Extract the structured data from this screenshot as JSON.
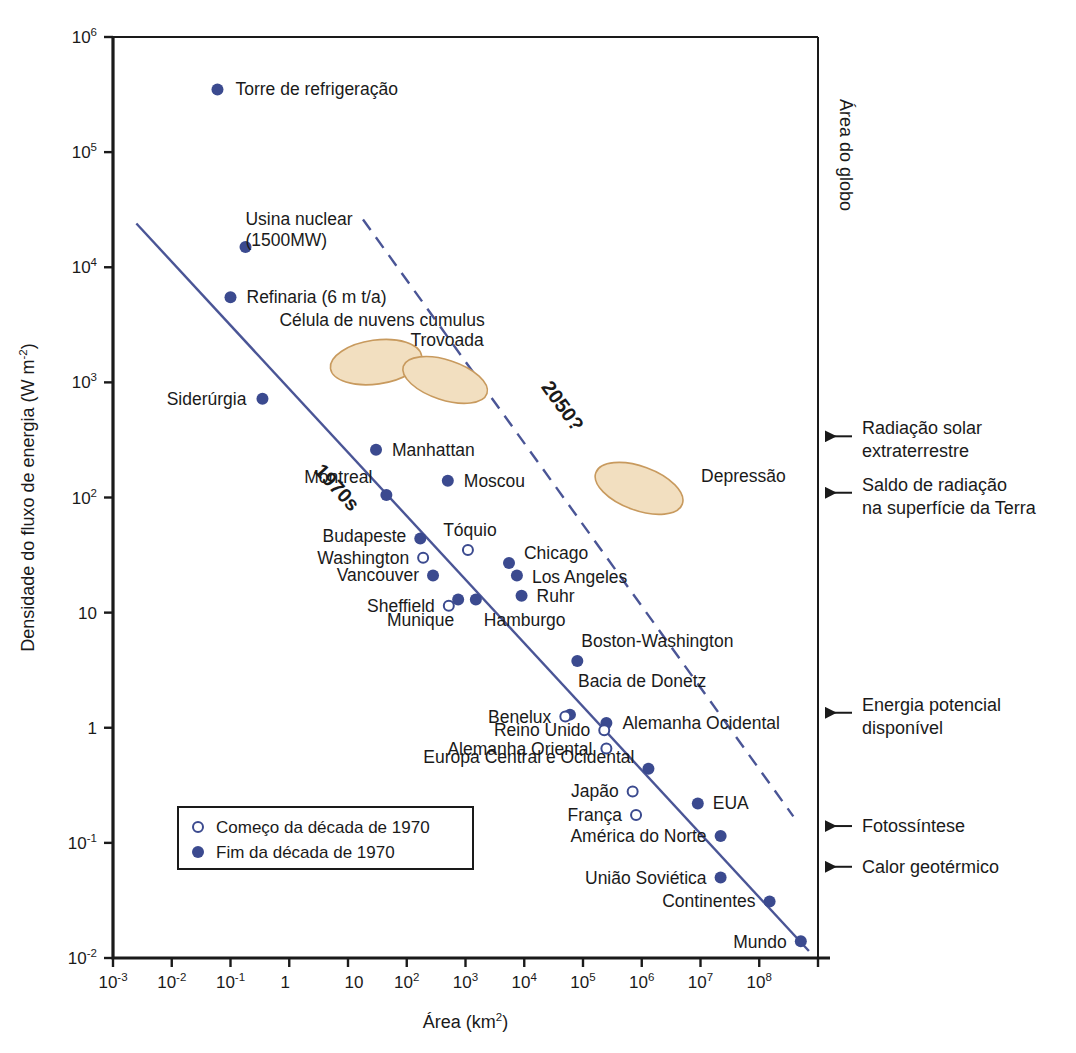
{
  "chart_data": {
    "type": "scatter",
    "title": "",
    "xlabel": "Área (km²)",
    "ylabel": "Densidade do fluxo de energia (W m⁻²)",
    "xscale": "log",
    "yscale": "log",
    "xlim": [
      0.001,
      1000000000
    ],
    "ylim": [
      0.01,
      1000000
    ],
    "grid": false,
    "legend_position": "bottom-left",
    "x_ticks": [
      {
        "label_base": "10",
        "label_exp": "-3",
        "value": 0.001
      },
      {
        "label_base": "10",
        "label_exp": "-2",
        "value": 0.01
      },
      {
        "label_base": "10",
        "label_exp": "-1",
        "value": 0.1
      },
      {
        "label_base": "1",
        "label_exp": "",
        "value": 1
      },
      {
        "label_base": "10",
        "label_exp": "",
        "value": 10
      },
      {
        "label_base": "",
        "label_exp": "",
        "value": 100
      },
      {
        "label_base": "10",
        "label_exp": "2",
        "value": 100
      },
      {
        "label_base": "10",
        "label_exp": "3",
        "value": 1000
      },
      {
        "label_base": "10",
        "label_exp": "4",
        "value": 10000
      },
      {
        "label_base": "10",
        "label_exp": "5",
        "value": 100000
      },
      {
        "label_base": "10",
        "label_exp": "6",
        "value": 1000000
      },
      {
        "label_base": "10",
        "label_exp": "7",
        "value": 10000000
      },
      {
        "label_base": "10",
        "label_exp": "8",
        "value": 100000000
      }
    ],
    "y_ticks": [
      {
        "label_base": "10",
        "label_exp": "6",
        "value": 1000000
      },
      {
        "label_base": "10",
        "label_exp": "5",
        "value": 100000
      },
      {
        "label_base": "10",
        "label_exp": "4",
        "value": 10000
      },
      {
        "label_base": "10",
        "label_exp": "3",
        "value": 1000
      },
      {
        "label_base": "10",
        "label_exp": "2",
        "value": 100
      },
      {
        "label_base": "10",
        "label_exp": "",
        "value": 10
      },
      {
        "label_base": "1",
        "label_exp": "",
        "value": 1
      },
      {
        "label_base": "10",
        "label_exp": "-1",
        "value": 0.1
      },
      {
        "label_base": "10",
        "label_exp": "-2",
        "value": 0.01
      }
    ],
    "series": [
      {
        "name": "Fim da década de 1970",
        "marker": "filled",
        "color": "#3b4a8f",
        "points": [
          {
            "label": "Torre de refrigeração",
            "x": 0.06,
            "y": 350000,
            "lx": 18,
            "ly": 6
          },
          {
            "label": "Usina nuclear\n(1500MW)",
            "x": 0.18,
            "y": 15000,
            "lx": 0,
            "ly": -22
          },
          {
            "label": "Refinaria (6 m t/a)",
            "x": 0.1,
            "y": 5500,
            "lx": 16,
            "ly": 6
          },
          {
            "label": "Siderúrgia",
            "x": 0.35,
            "y": 720,
            "lx": -16,
            "ly": 6,
            "anchor": "end"
          },
          {
            "label": "Manhattan",
            "x": 30,
            "y": 260,
            "lx": 16,
            "ly": 6
          },
          {
            "label": "Montreal",
            "x": 45,
            "y": 105,
            "lx": -14,
            "ly": -12,
            "anchor": "end"
          },
          {
            "label": "Moscou",
            "x": 500,
            "y": 140,
            "lx": 16,
            "ly": 6
          },
          {
            "label": "Budapeste",
            "x": 170,
            "y": 44,
            "lx": -14,
            "ly": 3,
            "anchor": "end"
          },
          {
            "label": "Vancouver",
            "x": 280,
            "y": 21,
            "lx": -14,
            "ly": 5,
            "anchor": "end"
          },
          {
            "label": "Munique",
            "x": 750,
            "y": 13,
            "lx": -4,
            "ly": 26,
            "anchor": "end"
          },
          {
            "label": "Hamburgo",
            "x": 1500,
            "y": 13,
            "lx": 8,
            "ly": 26
          },
          {
            "label": "Chicago",
            "x": 5500,
            "y": 27,
            "lx": 15,
            "ly": -4
          },
          {
            "label": "Los Angeles",
            "x": 7500,
            "y": 21,
            "lx": 15,
            "ly": 7
          },
          {
            "label": "Ruhr",
            "x": 9000,
            "y": 14,
            "lx": 15,
            "ly": 6
          },
          {
            "label": "Boston-Washington",
            "x": 80000,
            "y": 3.8,
            "lx": 4,
            "ly": -14
          },
          {
            "label": "Bacia de Donetz",
            "x": 60000,
            "y": 1.3,
            "lx": 8,
            "ly": -28
          },
          {
            "label": "Alemanha Ocidental",
            "x": 250000,
            "y": 1.1,
            "lx": 16,
            "ly": 6
          },
          {
            "label": "Europa Central e Ocidental",
            "x": 1300000,
            "y": 0.44,
            "lx": -14,
            "ly": -6,
            "anchor": "end"
          },
          {
            "label": "EUA",
            "x": 9000000,
            "y": 0.22,
            "lx": 15,
            "ly": 6
          },
          {
            "label": "América do Norte",
            "x": 22000000,
            "y": 0.115,
            "lx": -14,
            "ly": 6,
            "anchor": "end"
          },
          {
            "label": "União Soviética",
            "x": 22000000,
            "y": 0.05,
            "lx": -14,
            "ly": 6,
            "anchor": "end"
          },
          {
            "label": "Continentes",
            "x": 150000000,
            "y": 0.031,
            "lx": -14,
            "ly": 6,
            "anchor": "end"
          },
          {
            "label": "Mundo",
            "x": 510000000,
            "y": 0.014,
            "lx": -14,
            "ly": 7,
            "anchor": "end"
          }
        ]
      },
      {
        "name": "Começo da década de 1970",
        "marker": "hollow",
        "color": "#3b4a8f",
        "points": [
          {
            "label": "Washington",
            "x": 190,
            "y": 30,
            "lx": -14,
            "ly": 6,
            "anchor": "end"
          },
          {
            "label": "Tóquio",
            "x": 1100,
            "y": 35,
            "lx": 2,
            "ly": -14,
            "anchor": "middle"
          },
          {
            "label": "Sheffield",
            "x": 520,
            "y": 11.5,
            "lx": -14,
            "ly": 6,
            "anchor": "end"
          },
          {
            "label": "Benelux",
            "x": 50000,
            "y": 1.25,
            "lx": -14,
            "ly": 6,
            "anchor": "end"
          },
          {
            "label": "Reino Unido",
            "x": 230000,
            "y": 0.95,
            "lx": -14,
            "ly": 6,
            "anchor": "end"
          },
          {
            "label": "Alemanha Oriental",
            "x": 250000,
            "y": 0.66,
            "lx": -14,
            "ly": 6,
            "anchor": "end"
          },
          {
            "label": "Japão",
            "x": 700000,
            "y": 0.28,
            "lx": -14,
            "ly": 6,
            "anchor": "end"
          },
          {
            "label": "França",
            "x": 800000,
            "y": 0.175,
            "lx": -14,
            "ly": 6,
            "anchor": "end"
          }
        ]
      }
    ],
    "regions": [
      {
        "label": "Célula de nuvens cumulus",
        "cx": 30,
        "cy": 1500,
        "rx_px": 46,
        "ry_px": 22,
        "rot": -8,
        "lx": 6,
        "ly": -36,
        "anchor": "middle"
      },
      {
        "label": "Trovoada",
        "cx": 450,
        "cy": 1050,
        "rx_px": 44,
        "ry_px": 20,
        "rot": 18,
        "lx": 2,
        "ly": -34,
        "anchor": "middle"
      },
      {
        "label": "Depressão",
        "cx": 900000,
        "cy": 120,
        "rx_px": 46,
        "ry_px": 22,
        "rot": 20,
        "lx": 62,
        "ly": -6,
        "anchor": "start"
      }
    ],
    "trend_lines": [
      {
        "label": "1970s",
        "style": "solid",
        "x1": 0.0025,
        "y1": 24000,
        "x2": 700000000,
        "y2": 0.0115
      },
      {
        "label": "2050?",
        "style": "dashed",
        "x1": 18,
        "y1": 26000,
        "x2": 380000000,
        "y2": 0.17
      }
    ],
    "right_annotations": [
      {
        "label": "Área do globo",
        "kind": "bracket",
        "rotated": true
      },
      {
        "label": "Radiação solar\nextraterrestre",
        "value": 340,
        "kind": "arrow"
      },
      {
        "label": "Saldo de radiação\nna superfície da Terra",
        "value": 110,
        "kind": "arrow"
      },
      {
        "label": "Energia potencial\ndisponível",
        "value": 1.35,
        "kind": "arrow"
      },
      {
        "label": "Fotossíntese",
        "value": 0.14,
        "kind": "arrow"
      },
      {
        "label": "Calor geotérmico",
        "value": 0.062,
        "kind": "arrow"
      }
    ],
    "legend": {
      "items": [
        {
          "marker": "hollow",
          "label": "Começo da década de 1970"
        },
        {
          "marker": "filled",
          "label": "Fim da década de 1970"
        }
      ]
    },
    "colors": {
      "marker": "#3b4a8f",
      "line": "#4a5596",
      "region_fill": "#f2dfc0",
      "region_stroke": "#c89a5e",
      "axis": "#1a1a1a",
      "text": "#1a1a1a"
    }
  }
}
